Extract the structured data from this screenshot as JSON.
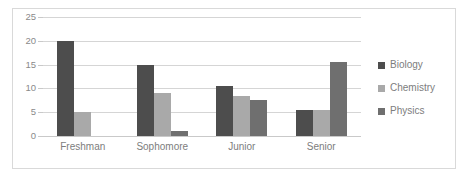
{
  "chart_data": {
    "type": "bar",
    "title": "",
    "xlabel": "",
    "ylabel": "",
    "categories": [
      "Freshman",
      "Sophomore",
      "Junior",
      "Senior"
    ],
    "series": [
      {
        "name": "Biology",
        "color": "#4d4d4d",
        "values": [
          20,
          15,
          10.5,
          5.5
        ]
      },
      {
        "name": "Chemistry",
        "color": "#a9a9a9",
        "values": [
          5,
          9,
          8.5,
          5.5
        ]
      },
      {
        "name": "Physics",
        "color": "#6f6f6f",
        "values": [
          0,
          1,
          7.5,
          15.5
        ]
      }
    ],
    "ylim": [
      0,
      25
    ],
    "yticks": [
      0,
      5,
      10,
      15,
      20,
      25
    ],
    "ytick_labels": [
      "0",
      "5",
      "10",
      "15",
      "20",
      "25"
    ],
    "grid": true,
    "legend_position": "right"
  }
}
